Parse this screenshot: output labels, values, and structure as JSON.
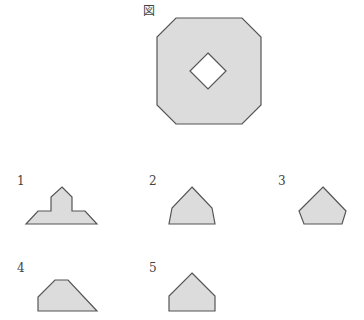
{
  "figure": {
    "title": "図",
    "main_shape": "octagon-with-diamond-hole"
  },
  "options": [
    {
      "number": "1",
      "shape": "cross-topped-trapezoid"
    },
    {
      "number": "2",
      "shape": "pentagon-pointed"
    },
    {
      "number": "3",
      "shape": "regular-pentagon"
    },
    {
      "number": "4",
      "shape": "trapezoid-cut"
    },
    {
      "number": "5",
      "shape": "house-pentagon"
    }
  ],
  "colors": {
    "fill": "#dcdcdc",
    "stroke": "#555555"
  }
}
